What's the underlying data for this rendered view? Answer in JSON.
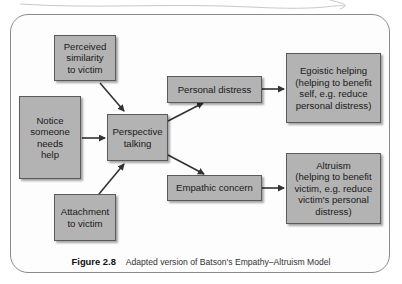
{
  "diagram": {
    "title": "Adapted version of Batson's Empathy–Altruism Model",
    "figure_label": "Figure 2.8",
    "nodes": {
      "perceived_similarity": "Perceived\nsimilarity\nto victim",
      "notice_help": "Notice\nsomeone\nneeds\nhelp",
      "attachment": "Attachment\nto victim",
      "perspective": "Perspective\ntalking",
      "personal_distress": "Personal distress",
      "empathic_concern": "Empathic concern",
      "egoistic": "Egoistic helping\n(helping to benefit\nself, e.g. reduce\npersonal distress)",
      "altruism": "Altruism\n(helping to benefit\nvictim, e.g. reduce\nvictim's personal\ndistress)"
    },
    "edges": [
      {
        "from": "perceived_similarity",
        "to": "perspective"
      },
      {
        "from": "notice_help",
        "to": "perspective"
      },
      {
        "from": "attachment",
        "to": "perspective"
      },
      {
        "from": "perspective",
        "to": "personal_distress"
      },
      {
        "from": "perspective",
        "to": "empathic_concern"
      },
      {
        "from": "personal_distress",
        "to": "egoistic"
      },
      {
        "from": "empathic_concern",
        "to": "altruism"
      }
    ],
    "colors": {
      "box_fill": "#b3b3b3",
      "box_border": "#5a5a5a",
      "arrow": "#333333",
      "frame": "#8a8a8a"
    }
  }
}
